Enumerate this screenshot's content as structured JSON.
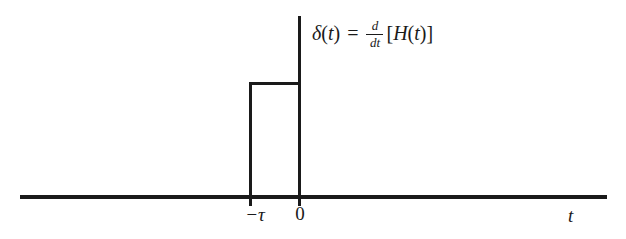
{
  "figure": {
    "title": "",
    "background_color": "#ffffff",
    "line_color": "#1a1a1a"
  },
  "equation": {
    "full_text": "δ(t) = d/dt [H(t)]",
    "lhs_function": "δ",
    "lhs_open_paren": "(",
    "lhs_variable": "t",
    "lhs_close_paren": ")",
    "equals": "=",
    "derivative_numerator": "d",
    "derivative_denominator": "dt",
    "bracket_open": "[",
    "rhs_function": "H",
    "rhs_open_paren": "(",
    "rhs_variable": "t",
    "rhs_close_paren": ")",
    "bracket_close": "]"
  },
  "axes": {
    "x_axis_label": "t",
    "y_axis_label": ""
  },
  "tick_labels": [
    {
      "text": "−τ",
      "value": -1
    },
    {
      "text": "0",
      "value": 0
    }
  ],
  "chart_data": {
    "type": "line",
    "title": "",
    "xlabel": "t",
    "ylabel": "",
    "x": [
      -1,
      -1,
      0,
      0
    ],
    "y": [
      0,
      1,
      1,
      0
    ],
    "xlim": [
      -2.4,
      2.95
    ],
    "ylim": [
      0,
      1.25
    ],
    "grid": false,
    "legend": false,
    "annotations": [
      "δ(t) = d/dt [H(t)]"
    ]
  }
}
